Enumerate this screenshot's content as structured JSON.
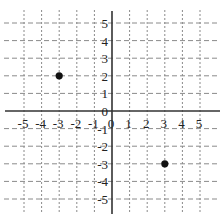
{
  "chart_data": {
    "type": "scatter",
    "title": "",
    "xlabel": "",
    "ylabel": "",
    "xlim": [
      -5,
      5
    ],
    "ylim": [
      -5,
      5
    ],
    "grid": true,
    "grid_style": "dashed",
    "x_ticks": [
      -5,
      -4,
      -3,
      -2,
      -1,
      0,
      1,
      2,
      3,
      4,
      5
    ],
    "y_ticks": [
      -5,
      -4,
      -3,
      -2,
      -1,
      0,
      1,
      2,
      3,
      4,
      5
    ],
    "x_tick_labels": [
      "-5",
      "-4",
      "-3",
      "-2",
      "-1",
      "0",
      "1",
      "2",
      "3",
      "4",
      "5"
    ],
    "y_tick_labels": [
      "-5",
      "-4",
      "-3",
      "-2",
      "-1",
      "0",
      "1",
      "2",
      "3",
      "4",
      "5"
    ],
    "series": [
      {
        "name": "points",
        "points": [
          {
            "x": -3,
            "y": 2
          },
          {
            "x": 3,
            "y": -3
          }
        ]
      }
    ],
    "legend": null
  },
  "colors": {
    "axis": "#333333",
    "grid": "#8a8a8a",
    "point": "#111111",
    "label": "#222222"
  }
}
